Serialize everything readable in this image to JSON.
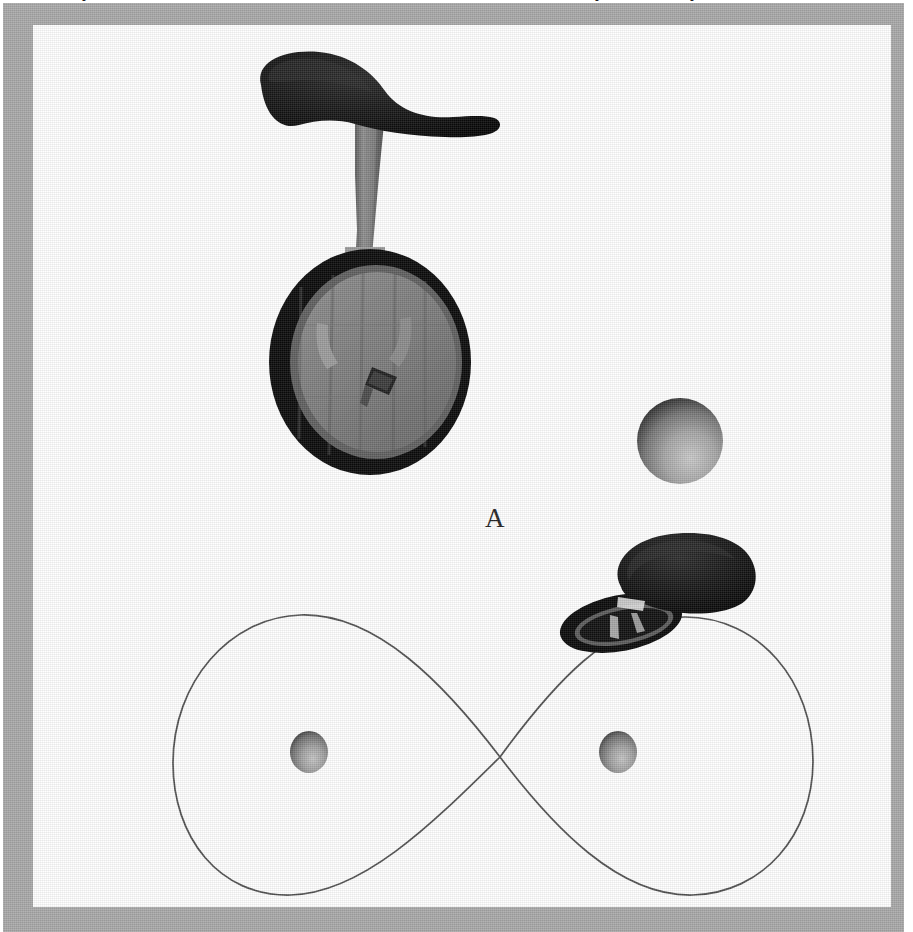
{
  "figure": {
    "type": "scientific-figure",
    "subject": "unicycle",
    "background_color": "#ffffff",
    "frame_color": "#a8a8a8",
    "ink_color": "#1a1a1a",
    "clipped_text_above": "y  y y",
    "panels": [
      {
        "id": "A",
        "label": "A",
        "description": "Three-dimensional perspective rendering of a unicycle with a spherical ball beside it",
        "objects": [
          {
            "name": "saddle",
            "color": "#0d0d0d",
            "shape": "elongated-curved-seat"
          },
          {
            "name": "seat-post",
            "color": "#6e6e6e",
            "shape": "tapered-column"
          },
          {
            "name": "fork",
            "color": "#8a8a8a",
            "shape": "two-pronged-yoke"
          },
          {
            "name": "wheel-tire",
            "color": "#0a0a0a",
            "shape": "ellipse-annulus"
          },
          {
            "name": "wheel-disc",
            "color": "#7d7d7d",
            "shape": "ellipse-spoked"
          },
          {
            "name": "pedal",
            "color": "#2a2a2a",
            "shape": "small-block"
          },
          {
            "name": "ball",
            "color": "#8f8f8f",
            "shape": "shaded-sphere",
            "radius_px": 43
          }
        ]
      },
      {
        "id": "B",
        "label": "B",
        "description": "Top-down plan view showing a figure-eight (lemniscate) trajectory around two cone markers, with the unicycle positioned on the upper-right lobe",
        "objects": [
          {
            "name": "trajectory-path",
            "color": "#4a4a4a",
            "shape": "lemniscate-figure-eight",
            "stroke_width_px": 1.6
          },
          {
            "name": "marker-left",
            "color": "#8f8f8f",
            "shape": "shaded-sphere",
            "radius_px": 19
          },
          {
            "name": "marker-right",
            "color": "#8f8f8f",
            "shape": "shaded-sphere",
            "radius_px": 19
          },
          {
            "name": "unicycle-top-view",
            "color": "#0d0d0d",
            "shape": "saddle-over-foreshortened-wheel"
          }
        ]
      }
    ]
  },
  "geometry": {
    "canvas": {
      "width": 913,
      "height": 932
    },
    "frame": {
      "x": 3,
      "y": 3,
      "width": 901,
      "height": 929,
      "inner_inset": 27
    },
    "panel_a_ball_center": {
      "x": 647,
      "y": 416
    },
    "panel_b_crossing_point": {
      "x": 497,
      "y": 732
    },
    "panel_b_left_marker": {
      "x": 306,
      "y": 727
    },
    "panel_b_right_marker": {
      "x": 615,
      "y": 727
    }
  }
}
